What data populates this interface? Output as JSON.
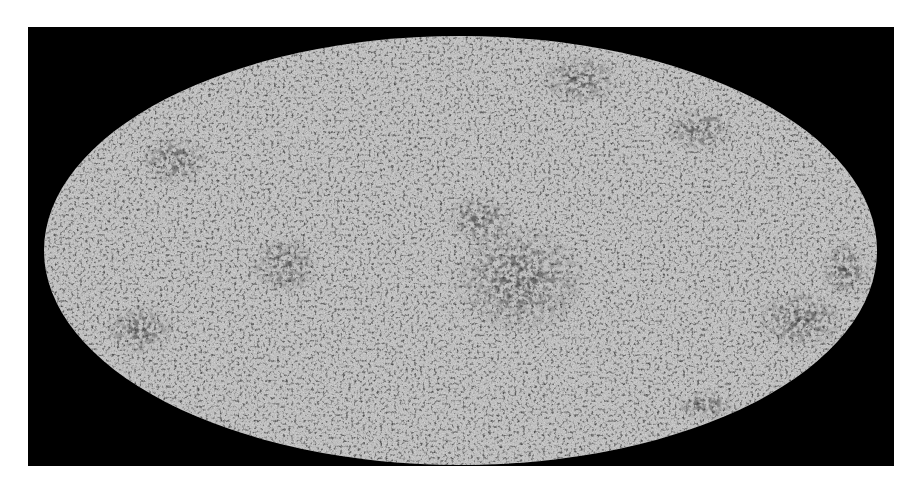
{
  "figure": {
    "projection": "mollweide-ellipse",
    "background_color": "#000000",
    "map_base_color": "#bdbdbd",
    "map_dark_color": "#4a4a4a",
    "frame": {
      "x": 28,
      "y": 27,
      "width": 866,
      "height": 439
    },
    "ellipse": {
      "cx": 460.5,
      "cy": 250.5,
      "rx": 416.5,
      "ry": 214.5
    },
    "dark_regions": [
      {
        "label": "center-cluster",
        "cx": 520,
        "cy": 280,
        "rx": 70,
        "ry": 55
      },
      {
        "label": "upper-right",
        "cx": 580,
        "cy": 80,
        "rx": 40,
        "ry": 25
      },
      {
        "label": "upper-right-2",
        "cx": 700,
        "cy": 130,
        "rx": 35,
        "ry": 22
      },
      {
        "label": "left-lower",
        "cx": 140,
        "cy": 330,
        "rx": 35,
        "ry": 25
      },
      {
        "label": "left-mid",
        "cx": 285,
        "cy": 265,
        "rx": 35,
        "ry": 30
      },
      {
        "label": "right-lower",
        "cx": 800,
        "cy": 320,
        "rx": 45,
        "ry": 30
      },
      {
        "label": "right-edge",
        "cx": 845,
        "cy": 270,
        "rx": 25,
        "ry": 30
      },
      {
        "label": "bottom-right",
        "cx": 705,
        "cy": 405,
        "rx": 30,
        "ry": 15
      },
      {
        "label": "upper-left",
        "cx": 175,
        "cy": 160,
        "rx": 35,
        "ry": 25
      },
      {
        "label": "center-upper",
        "cx": 480,
        "cy": 220,
        "rx": 35,
        "ry": 25
      }
    ]
  }
}
